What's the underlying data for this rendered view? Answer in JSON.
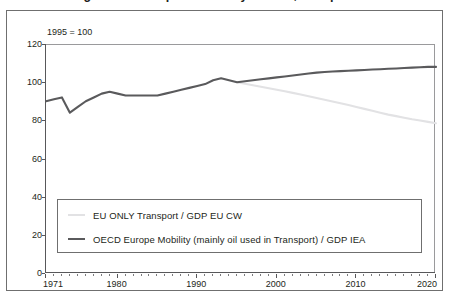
{
  "figure": {
    "caption_fragment": "Figure — Transport intensity of GDP, Europe",
    "note": "1995 = 100"
  },
  "colors": {
    "series_dark": "#5a5a5c",
    "series_light": "#e2e2e4",
    "axis": "#58585a",
    "frame": "#6f6f6f",
    "text": "#231f20",
    "background": "#ffffff"
  },
  "legend": {
    "position": "inside-lower-left",
    "entries": [
      {
        "label": "EU ONLY Transport / GDP EU CW",
        "swatch": "line-swatch-light",
        "color": "#e2e2e4"
      },
      {
        "label": "OECD Europe Mobility (mainly oil used in Transport) / GDP IEA",
        "swatch": "line-swatch-dark",
        "color": "#5a5a5c"
      }
    ]
  },
  "chart_data": {
    "type": "line",
    "title": "",
    "subtitle": "1995 = 100",
    "xlabel": "",
    "ylabel": "",
    "xlim": [
      1971,
      2020
    ],
    "ylim": [
      0,
      120
    ],
    "yticks": [
      0,
      20,
      40,
      60,
      80,
      100,
      120
    ],
    "ytick_labels": [
      "0",
      "20",
      "40",
      "60",
      "80",
      "100",
      "120"
    ],
    "xticks": [
      1971,
      1980,
      1990,
      2000,
      2010,
      2020
    ],
    "xtick_labels": [
      "1971",
      "1980",
      "1990",
      "2000",
      "2010",
      "2020"
    ],
    "minor_xticks_every": 1,
    "grid": false,
    "series": [
      {
        "name": "OECD Europe Mobility (mainly oil used in Transport) / GDP IEA",
        "color": "#5a5a5c",
        "width": 2.1,
        "x": [
          1971,
          1972,
          1973,
          1974,
          1975,
          1976,
          1977,
          1978,
          1979,
          1980,
          1981,
          1982,
          1983,
          1984,
          1985,
          1986,
          1987,
          1988,
          1989,
          1990,
          1991,
          1992,
          1993,
          1994,
          1995,
          1996,
          1997,
          1998,
          1999,
          2000,
          2001,
          2002,
          2003,
          2004,
          2005,
          2006,
          2007,
          2008,
          2009,
          2010,
          2011,
          2012,
          2013,
          2014,
          2015,
          2016,
          2017,
          2018,
          2019,
          2020
        ],
        "values": [
          90,
          91,
          92,
          84,
          87,
          90,
          92,
          94,
          95,
          94,
          93,
          93,
          93,
          93,
          93,
          94,
          95,
          96,
          97,
          98,
          99,
          101,
          102,
          101,
          100,
          100.5,
          101,
          101.5,
          102,
          102.5,
          103,
          103.5,
          104,
          104.5,
          105,
          105.3,
          105.6,
          105.8,
          106,
          106.2,
          106.4,
          106.6,
          106.8,
          107,
          107.2,
          107.4,
          107.6,
          107.8,
          108,
          108
        ]
      },
      {
        "name": "EU ONLY Transport / GDP EU CW",
        "color": "#e2e2e4",
        "width": 2.1,
        "x": [
          1995,
          1996,
          1997,
          1998,
          1999,
          2000,
          2001,
          2002,
          2003,
          2004,
          2005,
          2006,
          2007,
          2008,
          2009,
          2010,
          2011,
          2012,
          2013,
          2014,
          2015,
          2016,
          2017,
          2018,
          2019,
          2020
        ],
        "values": [
          100,
          99.2,
          98.4,
          97.6,
          96.8,
          96,
          95.2,
          94.4,
          93.5,
          92.6,
          91.7,
          90.8,
          89.9,
          89,
          88,
          87,
          86,
          85,
          84,
          83,
          82.2,
          81.4,
          80.6,
          79.9,
          79.2,
          78.5
        ]
      }
    ]
  }
}
